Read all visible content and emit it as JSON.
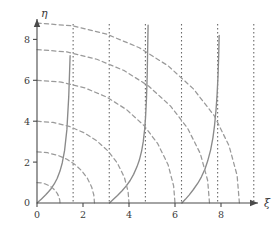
{
  "chart_data": {
    "type": "line",
    "title": "",
    "xlabel": "ξ",
    "ylabel": "η",
    "xlim": [
      -0.4,
      10.2
    ],
    "ylim": [
      -0.4,
      9.4
    ],
    "grid": false,
    "legend": null,
    "xticks": [
      0,
      2,
      4,
      6,
      8
    ],
    "xtick_labels": [
      "0",
      "2",
      "4",
      "6",
      "8"
    ],
    "yticks": [
      0,
      2,
      4,
      6,
      8
    ],
    "ytick_labels": [
      "0",
      "2",
      "4",
      "6",
      "8"
    ],
    "series": [
      {
        "name": "tan-branch-1",
        "style": "solid",
        "color": "#8a8a8a",
        "points": [
          [
            0.0,
            0.0
          ],
          [
            0.12,
            0.12
          ],
          [
            0.25,
            0.26
          ],
          [
            0.38,
            0.4
          ],
          [
            0.5,
            0.55
          ],
          [
            0.62,
            0.71
          ],
          [
            0.75,
            0.93
          ],
          [
            0.88,
            1.21
          ],
          [
            1.0,
            1.56
          ],
          [
            1.1,
            1.97
          ],
          [
            1.2,
            2.57
          ],
          [
            1.3,
            3.6
          ],
          [
            1.38,
            5.2
          ],
          [
            1.44,
            7.2
          ],
          [
            1.48,
            9.1
          ]
        ]
      },
      {
        "name": "tan-branch-2",
        "style": "solid",
        "color": "#8a8a8a",
        "points": [
          [
            3.15,
            0.0
          ],
          [
            3.3,
            0.16
          ],
          [
            3.5,
            0.37
          ],
          [
            3.7,
            0.6
          ],
          [
            3.9,
            0.86
          ],
          [
            4.05,
            1.1
          ],
          [
            4.2,
            1.4
          ],
          [
            4.35,
            1.78
          ],
          [
            4.45,
            2.1
          ],
          [
            4.55,
            2.55
          ],
          [
            4.62,
            3.0
          ],
          [
            4.68,
            3.6
          ],
          [
            4.72,
            4.2
          ],
          [
            4.76,
            5.1
          ],
          [
            4.79,
            6.2
          ],
          [
            4.81,
            7.4
          ],
          [
            4.83,
            8.7
          ],
          [
            4.84,
            9.3
          ]
        ]
      },
      {
        "name": "tan-branch-3",
        "style": "solid",
        "color": "#8a8a8a",
        "points": [
          [
            6.3,
            0.0
          ],
          [
            6.45,
            0.18
          ],
          [
            6.62,
            0.4
          ],
          [
            6.8,
            0.66
          ],
          [
            7.0,
            0.98
          ],
          [
            7.15,
            1.28
          ],
          [
            7.3,
            1.65
          ],
          [
            7.42,
            2.05
          ],
          [
            7.55,
            2.6
          ],
          [
            7.65,
            3.2
          ],
          [
            7.72,
            3.8
          ],
          [
            7.78,
            4.5
          ],
          [
            7.83,
            5.3
          ],
          [
            7.87,
            6.2
          ],
          [
            7.9,
            7.2
          ],
          [
            7.92,
            8.2
          ],
          [
            7.94,
            9.3
          ]
        ]
      },
      {
        "name": "circle-R-1",
        "style": "dashed",
        "color": "#9a9a9a",
        "radius": 1.0,
        "points": [
          [
            0.0,
            1.0
          ],
          [
            0.18,
            0.98
          ],
          [
            0.36,
            0.93
          ],
          [
            0.52,
            0.85
          ],
          [
            0.66,
            0.75
          ],
          [
            0.78,
            0.62
          ],
          [
            0.88,
            0.47
          ],
          [
            0.95,
            0.31
          ],
          [
            0.99,
            0.14
          ],
          [
            1.0,
            0.0
          ]
        ]
      },
      {
        "name": "circle-R-2",
        "style": "dashed",
        "color": "#9a9a9a",
        "radius": 2.5,
        "points": [
          [
            0.0,
            2.5
          ],
          [
            0.45,
            2.46
          ],
          [
            0.9,
            2.33
          ],
          [
            1.3,
            2.14
          ],
          [
            1.65,
            1.88
          ],
          [
            1.95,
            1.57
          ],
          [
            2.2,
            1.19
          ],
          [
            2.38,
            0.77
          ],
          [
            2.47,
            0.39
          ],
          [
            2.5,
            0.0
          ]
        ]
      },
      {
        "name": "circle-R-3",
        "style": "dashed",
        "color": "#9a9a9a",
        "radius": 4.0,
        "points": [
          [
            0.0,
            4.0
          ],
          [
            0.7,
            3.94
          ],
          [
            1.4,
            3.75
          ],
          [
            2.05,
            3.43
          ],
          [
            2.6,
            3.04
          ],
          [
            3.1,
            2.53
          ],
          [
            3.5,
            1.94
          ],
          [
            3.8,
            1.25
          ],
          [
            3.96,
            0.56
          ],
          [
            4.0,
            0.0
          ]
        ]
      },
      {
        "name": "circle-R-4",
        "style": "dashed",
        "color": "#9a9a9a",
        "radius": 6.0,
        "points": [
          [
            0.0,
            6.0
          ],
          [
            1.05,
            5.91
          ],
          [
            2.1,
            5.62
          ],
          [
            3.05,
            5.17
          ],
          [
            3.9,
            4.56
          ],
          [
            4.65,
            3.79
          ],
          [
            5.25,
            2.9
          ],
          [
            5.7,
            1.87
          ],
          [
            5.94,
            0.84
          ],
          [
            6.0,
            0.0
          ]
        ]
      },
      {
        "name": "circle-R-5",
        "style": "dashed",
        "color": "#9a9a9a",
        "radius": 7.5,
        "points": [
          [
            0.0,
            7.5
          ],
          [
            1.3,
            7.39
          ],
          [
            2.6,
            7.03
          ],
          [
            3.8,
            6.47
          ],
          [
            4.85,
            5.72
          ],
          [
            5.8,
            4.75
          ],
          [
            6.55,
            3.65
          ],
          [
            7.1,
            2.42
          ],
          [
            7.42,
            1.1
          ],
          [
            7.5,
            0.0
          ]
        ]
      },
      {
        "name": "circle-R-6",
        "style": "dashed",
        "color": "#9a9a9a",
        "radius": 8.8,
        "points": [
          [
            0.0,
            8.8
          ],
          [
            1.55,
            8.66
          ],
          [
            3.05,
            8.25
          ],
          [
            4.45,
            7.59
          ],
          [
            5.7,
            6.71
          ],
          [
            6.8,
            5.58
          ],
          [
            7.7,
            4.28
          ],
          [
            8.35,
            2.8
          ],
          [
            8.7,
            1.35
          ],
          [
            8.8,
            0.0
          ]
        ]
      }
    ],
    "asymptotes": {
      "name": "vertical-asymptotes",
      "style": "dotted",
      "color": "#6a6a6a",
      "x_values": [
        1.5708,
        3.1416,
        4.7124,
        6.2832,
        7.854,
        9.4248
      ]
    }
  }
}
